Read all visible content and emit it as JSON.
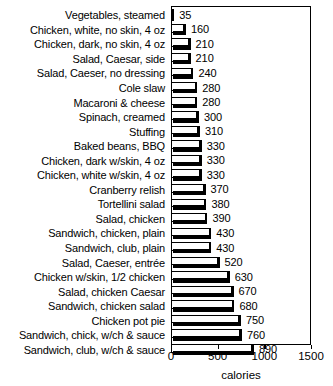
{
  "chart_data": {
    "type": "bar",
    "orientation": "horizontal",
    "title": "",
    "xlabel": "calories",
    "ylabel": "",
    "xlim": [
      0,
      1500
    ],
    "xticks": [
      0,
      500,
      1000,
      1500
    ],
    "xtick_labels": [
      "0",
      "500",
      "1000",
      "1500"
    ],
    "grid": false,
    "legend": false,
    "show_value_labels": true,
    "categories": [
      "Vegetables, steamed",
      "Chicken, white, no skin, 4 oz",
      "Chicken, dark, no skin, 4 oz",
      "Salad, Caesar, side",
      "Salad, Caeser, no dressing",
      "Cole slaw",
      "Macaroni & cheese",
      "Spinach, creamed",
      "Stuffing",
      "Baked beans, BBQ",
      "Chicken, dark w/skin, 4 oz",
      "Chicken, white w/skin, 4 oz",
      "Cranberry relish",
      "Tortellini salad",
      "Salad, chicken",
      "Sandwich, chicken, plain",
      "Sandwich, club, plain",
      "Salad, Caeser, entrée",
      "Chicken w/skin, 1/2 chicken",
      "Salad, chicken Caesar",
      "Sandwich, chicken salad",
      "Chicken pot pie",
      "Sandwich, chick, w/ch & sauce",
      "Sandwich, club, w/ch & sauce"
    ],
    "values": [
      35,
      160,
      210,
      210,
      240,
      280,
      280,
      300,
      310,
      330,
      330,
      330,
      370,
      380,
      390,
      430,
      430,
      520,
      630,
      670,
      680,
      750,
      760,
      890
    ],
    "value_labels": [
      "35",
      "160",
      "210",
      "210",
      "240",
      "280",
      "280",
      "300",
      "310",
      "330",
      "330",
      "330",
      "370",
      "380",
      "390",
      "430",
      "430",
      "520",
      "630",
      "670",
      "680",
      "750",
      "760",
      "890"
    ],
    "colors": {
      "bar_face": "#ffffff",
      "bar_edge": "#000000",
      "bar_shadow": "#000000",
      "axis": "#000000",
      "text": "#000000",
      "background": "#ffffff"
    }
  }
}
